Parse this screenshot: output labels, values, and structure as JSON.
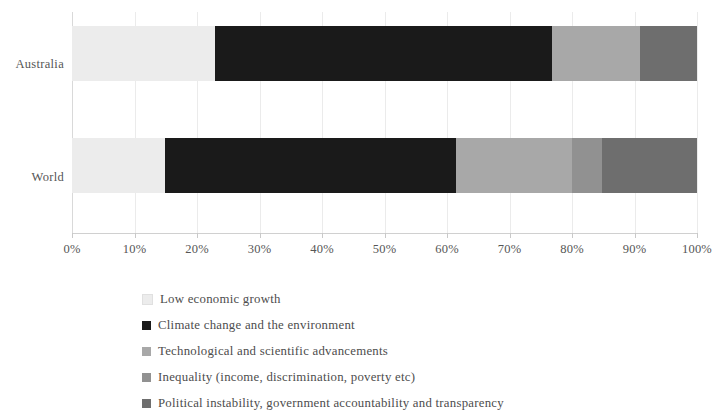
{
  "chart_data": {
    "type": "bar",
    "orientation": "horizontal",
    "stacked": true,
    "normalized": true,
    "title": "",
    "subtitle": "",
    "xlabel": "",
    "ylabel": "",
    "xlim": [
      0,
      100
    ],
    "grid": true,
    "legend_position": "bottom-left",
    "categories": [
      "Australia",
      "World"
    ],
    "xtick_labels": [
      "0%",
      "10%",
      "20%",
      "30%",
      "40%",
      "50%",
      "60%",
      "70%",
      "80%",
      "90%",
      "100%"
    ],
    "xtick_values": [
      0,
      10,
      20,
      30,
      40,
      50,
      60,
      70,
      80,
      90,
      100
    ],
    "series": [
      {
        "name": "Low economic growth",
        "color": "#ececec",
        "values": [
          22.9,
          14.9
        ]
      },
      {
        "name": "Climate change and the environment",
        "color": "#1a1a1a",
        "values": [
          53.9,
          46.5
        ]
      },
      {
        "name": "Technological and scientific advancements",
        "color": "#a8a8a8",
        "values": [
          14.1,
          18.6
        ]
      },
      {
        "name": "Inequality (income, discrimination, poverty etc)",
        "color": "#919191",
        "values": [
          0.0,
          4.8
        ]
      },
      {
        "name": "Political instability, government accountability and transparency",
        "color": "#6e6e6e",
        "values": [
          9.1,
          15.2
        ]
      }
    ]
  },
  "axis": {
    "category_labels": [
      "Australia",
      "World"
    ]
  },
  "legend": {
    "items": [
      "Low economic growth",
      "Climate change and the environment",
      "Technological and scientific advancements",
      "Inequality (income, discrimination, poverty etc)",
      "Political instability, government accountability and transparency"
    ]
  }
}
